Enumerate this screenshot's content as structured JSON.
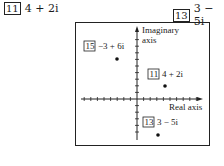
{
  "problems": [
    {
      "number": "11",
      "expression": "4 + 2i"
    },
    {
      "number": "13",
      "expression": "3 − 5i"
    }
  ],
  "diagram": {
    "y_axis_label_line1": "Imaginary",
    "y_axis_label_line2": "axis",
    "x_axis_label": "Real axis",
    "points": [
      {
        "number": "15",
        "expression": "−3 + 6i",
        "re": -3,
        "im": 6
      },
      {
        "number": "11",
        "expression": "4 + 2i",
        "re": 4,
        "im": 2
      },
      {
        "number": "13",
        "expression": "3 − 5i",
        "re": 3,
        "im": -5
      }
    ]
  }
}
